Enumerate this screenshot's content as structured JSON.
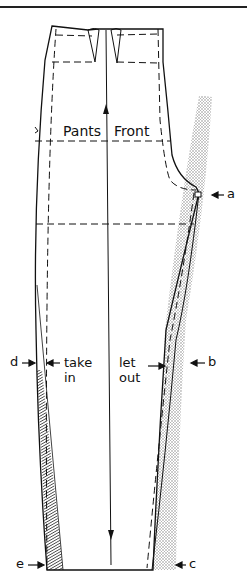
{
  "diagram": {
    "title_label": "Pants Front",
    "title_words": [
      "Pants",
      "Front"
    ],
    "annotations": {
      "take_in": [
        "take",
        "in"
      ],
      "let_out": [
        "let",
        "out"
      ]
    },
    "point_labels": {
      "a": "a",
      "b": "b",
      "c": "c",
      "d": "d",
      "e": "e"
    },
    "colors": {
      "line": "#111111",
      "stipple": "#9a9a9a",
      "hatch": "#333333",
      "background": "#ffffff"
    }
  }
}
